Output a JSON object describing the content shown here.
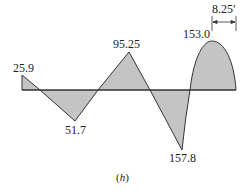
{
  "diagram": {
    "caption": "(h)",
    "caption_letter": "h",
    "fill_color": "#c4c4c4",
    "stroke_color": "#333333",
    "labels": {
      "v1": "25.9",
      "v2": "51.7",
      "v3": "95.25",
      "v4": "157.8",
      "v5": "153.0",
      "dimension": "8.25′"
    },
    "values": [
      {
        "label": "25.9",
        "sign": "positive"
      },
      {
        "label": "51.7",
        "sign": "negative"
      },
      {
        "label": "95.25",
        "sign": "positive"
      },
      {
        "label": "157.8",
        "sign": "negative"
      },
      {
        "label": "153.0",
        "sign": "positive",
        "shape": "parabolic"
      }
    ]
  }
}
